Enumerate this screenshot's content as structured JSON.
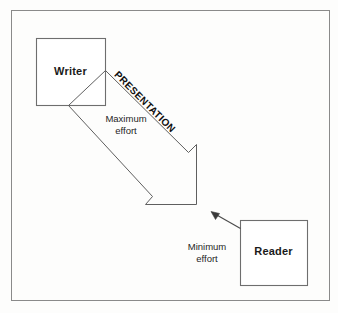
{
  "diagram": {
    "background_color": "#fdfdfc",
    "stroke_color": "#6e6e6e",
    "text_color": "#1a1a1a",
    "border": {
      "name": "outer-frame"
    },
    "nodes": [
      {
        "id": "writer",
        "label": "Writer",
        "x": 36,
        "y": 38,
        "width": 69,
        "height": 67
      },
      {
        "id": "reader",
        "label": "Reader",
        "x": 240,
        "y": 220,
        "width": 67,
        "height": 65
      }
    ],
    "arrows": [
      {
        "id": "presentation-arrow",
        "label": "PRESENTATION",
        "style": "block-arrow-outline",
        "from": "writer",
        "to": "presentation-point",
        "direction": "down-right",
        "secondary_label": "Maximum\neffort"
      },
      {
        "id": "reader-arrow",
        "style": "thin-line-arrow",
        "from": "reader",
        "to": "presentation-point",
        "direction": "up-left",
        "secondary_label": "Minimum\neffort"
      }
    ],
    "labels": {
      "presentation": "PRESENTATION",
      "maximum_effort_line1": "Maximum",
      "maximum_effort_line2": "effort",
      "minimum_effort_line1": "Minimum",
      "minimum_effort_line2": "effort"
    }
  }
}
